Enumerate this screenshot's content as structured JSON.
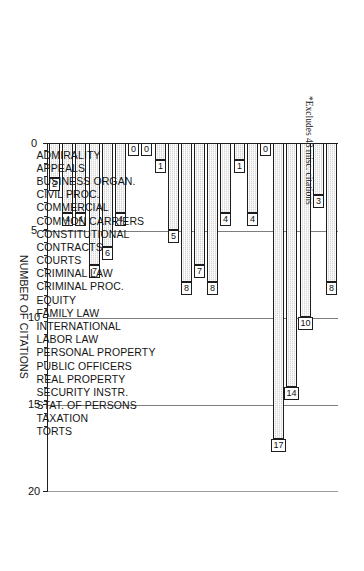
{
  "chart_data": {
    "type": "bar",
    "orientation": "vertical-rotated",
    "title": "",
    "xlabel": "",
    "ylabel": "NUMBER OF CITATIONS",
    "ylim": [
      0,
      20
    ],
    "yticks": [
      0,
      5,
      10,
      15,
      20
    ],
    "grid": true,
    "legend": null,
    "categories": [
      "ADMIRALITY",
      "APPEALS",
      "BUSINESS ORGAN.",
      "CIVIL PROC.",
      "COMMERCIAL",
      "COMMON CARRIERS",
      "CONSTITUTIONAL",
      "CONTRACTS",
      "COURTS",
      "CRIMINAL LAW",
      "CRIMINAL PROC.",
      "EQUITY",
      "FAMILY LAW",
      "INTERNATIONAL",
      "LABOR LAW",
      "PERSONAL PROPERTY",
      "PUBLIC OFFICERS",
      "REAL PROPERTY",
      "SECURITY INSTR.",
      "STAT. OF PERSONS",
      "TAXATION",
      "TORTS"
    ],
    "values": [
      8,
      3,
      10,
      14,
      17,
      0,
      4,
      1,
      4,
      8,
      7,
      8,
      5,
      1,
      0,
      0,
      4,
      6,
      7,
      4,
      4,
      2
    ],
    "value_labels": [
      "8",
      "3",
      "10",
      "14",
      "17",
      "0",
      "4",
      "1",
      "4",
      "8",
      "7",
      "8",
      "5",
      "1",
      "0",
      "0",
      "4",
      "6",
      "7",
      "4",
      "4",
      "2"
    ],
    "annotations": [
      "*Excludes 43 misc. citations"
    ]
  },
  "axis": {
    "value_axis_title": "NUMBER OF CITATIONS",
    "tick_labels": [
      "0",
      "5",
      "10",
      "15",
      "20"
    ]
  },
  "footnote": {
    "text": "*Excludes 43 misc. citations"
  },
  "style": {
    "bar_fill": "#d7d7d7",
    "bar_stroke": "#1d1d1d",
    "grid_color": "#7d7d7d",
    "axis_color": "#202020",
    "text_color": "#141414",
    "background": "#ffffff"
  }
}
